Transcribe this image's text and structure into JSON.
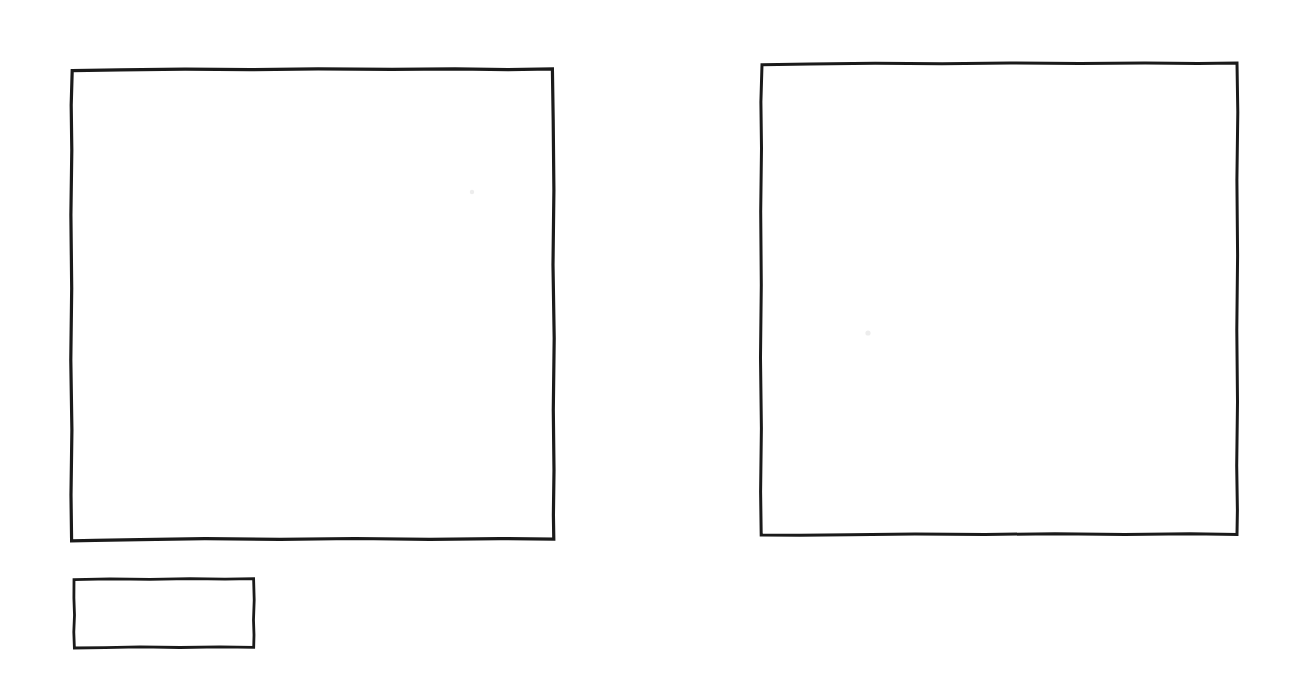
{
  "canvas": {
    "width": 1298,
    "height": 691,
    "background_color": "#ffffff",
    "ink_color": "#1a1a1a",
    "style": "hand-drawn-pen-sketch",
    "title": "Hand-drawn wireframe sketch with three rectangles"
  },
  "shapes": [
    {
      "id": "large-square-left",
      "name": "large-square-left",
      "label": "Large square (left)",
      "type": "rectangle",
      "x": 71,
      "y": 69,
      "width": 483,
      "height": 472,
      "stroke_width": 3.2,
      "fill": "none",
      "stroke_color": "#1a1a1a"
    },
    {
      "id": "large-square-right",
      "name": "large-square-right",
      "label": "Large square (right)",
      "type": "rectangle",
      "x": 761,
      "y": 63,
      "width": 477,
      "height": 472,
      "stroke_width": 3.0,
      "fill": "none",
      "stroke_color": "#1a1a1a"
    },
    {
      "id": "small-rectangle-bottom-left",
      "name": "small-rectangle-bottom-left",
      "label": "Small rectangle (bottom left)",
      "type": "rectangle",
      "x": 73,
      "y": 578,
      "width": 181,
      "height": 70,
      "stroke_width": 2.8,
      "fill": "none",
      "stroke_color": "#1a1a1a"
    }
  ],
  "artifacts": [
    {
      "id": "speck-left",
      "name": "scan-speck-left",
      "x": 472,
      "y": 192,
      "radius": 2.2,
      "color": "#ededed"
    },
    {
      "id": "speck-right",
      "name": "scan-speck-right",
      "x": 868,
      "y": 333,
      "radius": 2.6,
      "color": "#ededed"
    }
  ],
  "paths": {
    "large_square_left": "M72.2,70.6 L120,69.8 L185,69.1 L250,69.6 L318,68.9 L392,69.4 L455,68.8 L508,69.7 L552.4,69.0 L553.2,120 L553.9,190 L553.0,265 L554.2,338 L553.3,410 L554.0,470 L553.4,515 L553.8,539.2 L500,538.6 L430,539.4 L355,538.5 L280,539.3 L205,538.7 L140,539.6 L95,540.4 L71.6,540.8 L71.0,495 L71.9,430 L70.8,360 L71.7,288 L70.9,215 L71.8,150 L71.2,105 Z",
    "large_square_right": "M762.0,64.8 L810,63.9 L875,63.2 L942,63.8 L1010,63.0 L1080,63.6 L1145,62.9 L1198,63.5 L1237.0,63.0 L1237.8,112 L1236.9,180 L1237.6,255 L1236.8,330 L1237.5,402 L1236.7,466 L1237.4,510 L1237.0,534.4 L1190,533.8 L1125,534.6 L1055,533.7 L985,534.5 L915,533.9 L850,534.7 L800,535.2 L761.2,535.0 L760.6,492 L761.4,428 L760.5,358 L761.3,285 L760.7,212 L761.5,148 L760.9,102 Z",
    "small_rectangle": "M74.0,579.6 L110,578.9 L150,579.4 L190,578.7 L225,579.2 L253.6,578.6 L254.2,600 L253.5,620 L254.0,635 L253.7,647.4 L220,646.8 L180,647.5 L140,646.9 L105,647.6 L74.4,648.0 L73.8,632 L74.5,615 L73.9,598 Z"
  }
}
